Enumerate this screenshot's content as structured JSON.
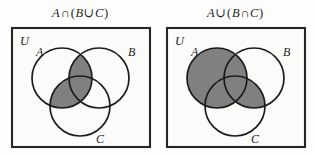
{
  "figure": {
    "name": "venn-diagram-pair",
    "background_color": "#fdfdfc",
    "ink_color": "#1d1d1d",
    "shade_color": "#808080"
  },
  "panels": [
    {
      "id": "left",
      "title": "A∩(B∪C)",
      "title_parts": {
        "a": "A",
        "outer_op": "∩",
        "open": "(",
        "b": "B",
        "inner_op": "∪",
        "c": "C",
        "close": ")"
      },
      "universe_label": "U",
      "labels": {
        "a": "A",
        "b": "B",
        "c": "C"
      },
      "shaded_description": "intersection of A with the union of B and C",
      "shaded_regions": [
        "A∩B",
        "A∩C",
        "A∩B∩C"
      ]
    },
    {
      "id": "right",
      "title": "A∪(B∩C)",
      "title_parts": {
        "a": "A",
        "outer_op": "∪",
        "open": "(",
        "b": "B",
        "inner_op": "∩",
        "c": "C",
        "close": ")"
      },
      "universe_label": "U",
      "labels": {
        "a": "A",
        "b": "B",
        "c": "C"
      },
      "shaded_description": "union of A with the intersection of B and C",
      "shaded_regions": [
        "A",
        "B∩C"
      ]
    }
  ]
}
